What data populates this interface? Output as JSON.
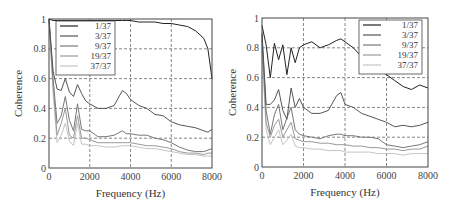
{
  "chart_data": [
    {
      "type": "line",
      "title": "",
      "xlabel": "Frequency (Hz)",
      "ylabel": "Coherence",
      "xlim": [
        0,
        8000
      ],
      "ylim": [
        0,
        1
      ],
      "xticks": [
        "0",
        "2000",
        "4000",
        "6000",
        "8000"
      ],
      "yticks": [
        "0",
        "0.2",
        "0.4",
        "0.6",
        "0.8",
        "1"
      ],
      "grid": true,
      "legend_position": "upper left",
      "x": [
        0,
        200,
        400,
        600,
        800,
        1000,
        1200,
        1400,
        1600,
        1800,
        2000,
        2400,
        2800,
        3200,
        3600,
        3800,
        4000,
        4400,
        4800,
        5200,
        5600,
        6000,
        6400,
        6800,
        7200,
        7600,
        7800,
        8000
      ],
      "series": [
        {
          "name": "1/37",
          "color": "#222222",
          "values": [
            1.0,
            0.99,
            0.99,
            0.99,
            0.99,
            0.99,
            0.99,
            0.99,
            0.99,
            0.99,
            0.99,
            0.99,
            0.99,
            0.99,
            0.99,
            0.99,
            0.99,
            0.98,
            0.98,
            0.98,
            0.97,
            0.97,
            0.96,
            0.95,
            0.92,
            0.87,
            0.8,
            0.6
          ]
        },
        {
          "name": "3/37",
          "color": "#555555",
          "values": [
            1.0,
            0.65,
            0.53,
            0.52,
            0.6,
            0.51,
            0.48,
            0.56,
            0.5,
            0.45,
            0.43,
            0.4,
            0.4,
            0.42,
            0.52,
            0.5,
            0.46,
            0.42,
            0.4,
            0.36,
            0.35,
            0.31,
            0.29,
            0.28,
            0.27,
            0.25,
            0.24,
            0.26
          ]
        },
        {
          "name": "9/37",
          "color": "#777777",
          "values": [
            1.0,
            0.6,
            0.3,
            0.35,
            0.48,
            0.32,
            0.25,
            0.43,
            0.26,
            0.25,
            0.25,
            0.21,
            0.21,
            0.22,
            0.25,
            0.23,
            0.23,
            0.22,
            0.22,
            0.2,
            0.19,
            0.17,
            0.14,
            0.12,
            0.11,
            0.11,
            0.12,
            0.13
          ]
        },
        {
          "name": "19/37",
          "color": "#999999",
          "values": [
            1.0,
            0.55,
            0.22,
            0.3,
            0.4,
            0.22,
            0.2,
            0.35,
            0.2,
            0.2,
            0.19,
            0.17,
            0.17,
            0.17,
            0.17,
            0.17,
            0.17,
            0.16,
            0.15,
            0.15,
            0.14,
            0.13,
            0.11,
            0.1,
            0.1,
            0.09,
            0.1,
            0.1
          ]
        },
        {
          "name": "37/37",
          "color": "#c4c4c4",
          "values": [
            1.0,
            0.5,
            0.17,
            0.22,
            0.3,
            0.18,
            0.15,
            0.3,
            0.16,
            0.16,
            0.15,
            0.15,
            0.14,
            0.14,
            0.15,
            0.15,
            0.15,
            0.14,
            0.13,
            0.13,
            0.12,
            0.11,
            0.1,
            0.09,
            0.09,
            0.08,
            0.08,
            0.08
          ]
        }
      ]
    },
    {
      "type": "line",
      "title": "",
      "xlabel": "Frequency (Hz)",
      "ylabel": "Coherence",
      "xlim": [
        0,
        8000
      ],
      "ylim": [
        0,
        1
      ],
      "xticks": [
        "0",
        "2000",
        "4000",
        "6000",
        "8000"
      ],
      "yticks": [
        "0",
        "0.2",
        "0.4",
        "0.6",
        "0.8",
        "1"
      ],
      "grid": true,
      "legend_position": "upper right",
      "x": [
        0,
        200,
        400,
        600,
        800,
        1000,
        1200,
        1400,
        1600,
        1800,
        2000,
        2400,
        2800,
        3200,
        3600,
        3800,
        4000,
        4400,
        4800,
        5200,
        5600,
        6000,
        6400,
        6800,
        7200,
        7600,
        8000
      ],
      "series": [
        {
          "name": "1/37",
          "color": "#222222",
          "values": [
            0.95,
            0.82,
            0.6,
            0.83,
            0.72,
            0.82,
            0.62,
            0.8,
            0.7,
            0.8,
            0.82,
            0.84,
            0.8,
            0.82,
            0.85,
            0.86,
            0.84,
            0.8,
            0.74,
            0.7,
            0.66,
            0.62,
            0.58,
            0.54,
            0.52,
            0.55,
            0.53
          ]
        },
        {
          "name": "3/37",
          "color": "#555555",
          "values": [
            0.9,
            0.42,
            0.42,
            0.45,
            0.52,
            0.38,
            0.32,
            0.53,
            0.4,
            0.46,
            0.4,
            0.36,
            0.36,
            0.38,
            0.48,
            0.5,
            0.42,
            0.4,
            0.36,
            0.34,
            0.32,
            0.3,
            0.27,
            0.28,
            0.27,
            0.28,
            0.3
          ]
        },
        {
          "name": "9/37",
          "color": "#777777",
          "values": [
            0.88,
            0.38,
            0.22,
            0.35,
            0.42,
            0.25,
            0.33,
            0.4,
            0.25,
            0.22,
            0.21,
            0.2,
            0.19,
            0.21,
            0.22,
            0.22,
            0.21,
            0.21,
            0.2,
            0.2,
            0.19,
            0.15,
            0.14,
            0.13,
            0.14,
            0.15,
            0.17
          ]
        },
        {
          "name": "19/37",
          "color": "#999999",
          "values": [
            0.85,
            0.3,
            0.2,
            0.28,
            0.32,
            0.2,
            0.25,
            0.3,
            0.19,
            0.18,
            0.17,
            0.17,
            0.16,
            0.16,
            0.15,
            0.15,
            0.15,
            0.14,
            0.14,
            0.13,
            0.13,
            0.12,
            0.12,
            0.11,
            0.12,
            0.12,
            0.14
          ]
        },
        {
          "name": "37/37",
          "color": "#c4c4c4",
          "values": [
            0.8,
            0.25,
            0.15,
            0.2,
            0.25,
            0.15,
            0.18,
            0.22,
            0.14,
            0.13,
            0.13,
            0.12,
            0.12,
            0.11,
            0.11,
            0.11,
            0.1,
            0.1,
            0.1,
            0.1,
            0.09,
            0.09,
            0.09,
            0.08,
            0.09,
            0.09,
            0.09
          ]
        }
      ]
    }
  ]
}
